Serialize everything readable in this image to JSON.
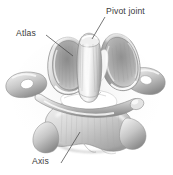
{
  "figure": {
    "kind": "anatomical-illustration",
    "background_color": "#ffffff",
    "ink_color": "#3b3b3b",
    "bone_light": "#fbfbfb",
    "bone_mid": "#c9c9c9",
    "bone_shadow": "#8d8d8d",
    "bone_dark": "#6a6a6a"
  },
  "labels": {
    "pivot_joint": "Pivot joint",
    "atlas": "Atlas",
    "axis": "Axis"
  },
  "leaders": [
    {
      "name": "pivot-joint-leader",
      "x1": 105,
      "y1": 17,
      "x2": 92,
      "y2": 39
    },
    {
      "name": "atlas-leader",
      "x1": 46,
      "y1": 35,
      "x2": 73,
      "y2": 56
    },
    {
      "name": "axis-leader",
      "x1": 61,
      "y1": 163,
      "x2": 80,
      "y2": 132
    }
  ]
}
